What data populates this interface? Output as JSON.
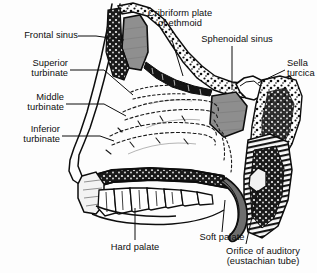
{
  "figure": {
    "background_color": "#fdfdfd",
    "ink_color": "#0d0d0d",
    "cavity_fill": "#8f8f8f",
    "bone_fill": "#ffffff"
  },
  "labels": {
    "frontal_sinus": "Frontal sinus",
    "superior_turbinate": "Superior\nturbinate",
    "middle_turbinate": "Middle\nturbinate",
    "inferior_turbinate": "Inferior\nturbinate",
    "cribriform_plate": "Cribriform plate\nof ethmoid",
    "sphenoidal_sinus": "Sphenoidal sinus",
    "sella_turcica": "Sella\nturcica",
    "hard_palate": "Hard palate",
    "soft_palate": "Soft palate",
    "orifice_auditory": "Orifice of auditory\n(eustachian tube)"
  }
}
